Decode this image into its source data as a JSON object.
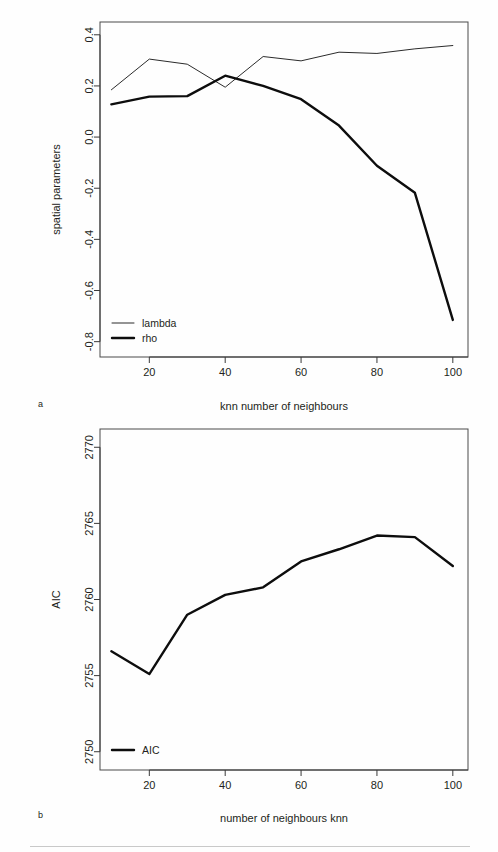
{
  "figure": {
    "panel_a_letter": "a",
    "panel_b_letter": "b"
  },
  "chart_data": [
    {
      "id": "panel-a",
      "type": "line",
      "title": "",
      "xlabel": "knn number of neighbours",
      "ylabel": "spatial parameters",
      "x": [
        10,
        20,
        30,
        40,
        50,
        60,
        70,
        80,
        90,
        100
      ],
      "xlim": [
        7,
        104
      ],
      "ylim": [
        -0.86,
        0.45
      ],
      "xticks": [
        20,
        40,
        60,
        80,
        100
      ],
      "xticklabels": [
        "20",
        "40",
        "60",
        "80",
        "100"
      ],
      "yticks": [
        0.4,
        0.2,
        0.0,
        -0.2,
        -0.4,
        -0.6,
        -0.8
      ],
      "yticklabels": [
        "0.4",
        "0.2",
        "0.0",
        "-0.2",
        "-0.4",
        "-0.6",
        "-0.8"
      ],
      "grid": false,
      "legend_position": "bottom-left",
      "series": [
        {
          "name": "lambda",
          "style": "thin",
          "color": "#2b2b2b",
          "values": [
            0.185,
            0.305,
            0.285,
            0.195,
            0.315,
            0.298,
            0.332,
            0.327,
            0.345,
            0.358
          ]
        },
        {
          "name": "rho",
          "style": "thick",
          "color": "#0d0d0d",
          "values": [
            0.128,
            0.158,
            0.16,
            0.24,
            0.2,
            0.148,
            0.045,
            -0.112,
            -0.218,
            -0.715
          ]
        }
      ]
    },
    {
      "id": "panel-b",
      "type": "line",
      "title": "",
      "xlabel": "number of neighbours knn",
      "ylabel": "AIC",
      "x": [
        10,
        20,
        30,
        40,
        50,
        60,
        70,
        80,
        90,
        100
      ],
      "xlim": [
        7,
        104
      ],
      "ylim": [
        2748.8,
        2771.2
      ],
      "xticks": [
        20,
        40,
        60,
        80,
        100
      ],
      "xticklabels": [
        "20",
        "40",
        "60",
        "80",
        "100"
      ],
      "yticks": [
        2770,
        2765,
        2760,
        2755,
        2750
      ],
      "yticklabels": [
        "2770",
        "2765",
        "2760",
        "2755",
        "2750"
      ],
      "grid": false,
      "legend_position": "bottom-left",
      "series": [
        {
          "name": "AIC",
          "style": "thick",
          "color": "#0d0d0d",
          "values": [
            2756.6,
            2755.1,
            2759.0,
            2760.3,
            2760.8,
            2762.5,
            2763.3,
            2764.2,
            2764.1,
            2762.2
          ]
        }
      ]
    }
  ]
}
